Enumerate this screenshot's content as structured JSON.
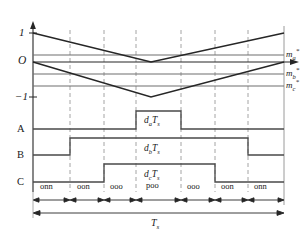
{
  "figure": {
    "type": "timing-diagram"
  },
  "axes": {
    "y_ticks": [
      {
        "label": "1",
        "value": 1,
        "y_px": 33
      },
      {
        "label": "O",
        "value": 0,
        "y_px": 62
      },
      {
        "label": "−1",
        "value": -1,
        "y_px": 97
      }
    ],
    "phase_rows": [
      {
        "label": "A",
        "y_px": 129
      },
      {
        "label": "B",
        "y_px": 155
      },
      {
        "label": "C",
        "y_px": 182
      }
    ],
    "origin_x_px": 33,
    "end_x_px": 284,
    "arrow_up": true,
    "arrow_right": true
  },
  "carriers": [
    {
      "name": "upper-carrier",
      "start": 1,
      "min": 0,
      "end": 1
    },
    {
      "name": "lower-carrier",
      "start": 0,
      "min": -1,
      "end": 0
    }
  ],
  "references": [
    {
      "name": "m_a_star",
      "label_main": "m",
      "label_sub": "a",
      "label_sup": "*",
      "y_px": 55
    },
    {
      "name": "m_b_star",
      "label_main": "m",
      "label_sub": "b",
      "label_sup": "*",
      "y_px": 74
    },
    {
      "name": "m_c_star",
      "label_main": "m",
      "label_sub": "c",
      "label_sup": "*",
      "y_px": 86
    }
  ],
  "duty_labels": [
    {
      "name": "d_a_Ts",
      "main": "d",
      "sub": "a",
      "tail": "T",
      "tail_sub": "s"
    },
    {
      "name": "d_b_Ts",
      "main": "d",
      "sub": "b",
      "tail": "T",
      "tail_sub": "s"
    },
    {
      "name": "d_c_Ts",
      "main": "d",
      "sub": "c",
      "tail": "T",
      "tail_sub": "s"
    }
  ],
  "poo_label": "poo",
  "switching_states": [
    {
      "label": "onn",
      "x_start": 33,
      "x_end": 70
    },
    {
      "label": "oon",
      "x_start": 70,
      "x_end": 104
    },
    {
      "label": "ooo",
      "x_start": 104,
      "x_end": 136
    },
    {
      "label": "poo",
      "x_start": 136,
      "x_end": 181
    },
    {
      "label": "ooo",
      "x_start": 181,
      "x_end": 215
    },
    {
      "label": "oon",
      "x_start": 215,
      "x_end": 248
    },
    {
      "label": "onn",
      "x_start": 248,
      "x_end": 284
    }
  ],
  "period": {
    "label_main": "T",
    "label_sub": "s",
    "x_start": 33,
    "x_end": 284
  },
  "waveforms": {
    "A": {
      "low": 129,
      "high": 111,
      "edges": [
        136,
        181
      ]
    },
    "B": {
      "low": 155,
      "high": 138,
      "edges": [
        70,
        248
      ]
    },
    "C": {
      "low": 182,
      "high": 164,
      "edges": [
        104,
        215
      ]
    }
  },
  "dashed_lines_x": [
    70,
    104,
    136,
    181,
    215,
    248
  ],
  "colors": {
    "stroke": "#262626",
    "gridline": "#8c8c8c",
    "dashed": "#9a9a9a",
    "background": "#ffffff"
  }
}
